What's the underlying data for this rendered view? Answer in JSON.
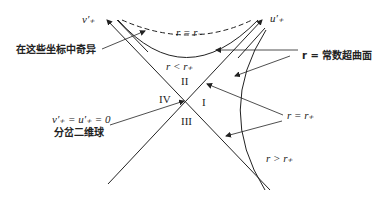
{
  "axes": {
    "v_label": "v′₊",
    "u_label": "u′₊"
  },
  "regions": {
    "I": "I",
    "II": "II",
    "III": "III",
    "IV": "IV"
  },
  "curve_labels": {
    "r_minus": "r = r₋",
    "r_less": "r < r₊",
    "r_plus": "r = r₊",
    "r_greater": "r > r₊"
  },
  "annotations": {
    "singular": "在这些坐标中奇异",
    "const_surface": "r = 常数超曲面",
    "bifurcation_eq": "v′₊ = u′₊ = 0",
    "bifurcation_text": "分岔二维球"
  },
  "colors": {
    "ink": "#222222",
    "background": "#ffffff"
  }
}
